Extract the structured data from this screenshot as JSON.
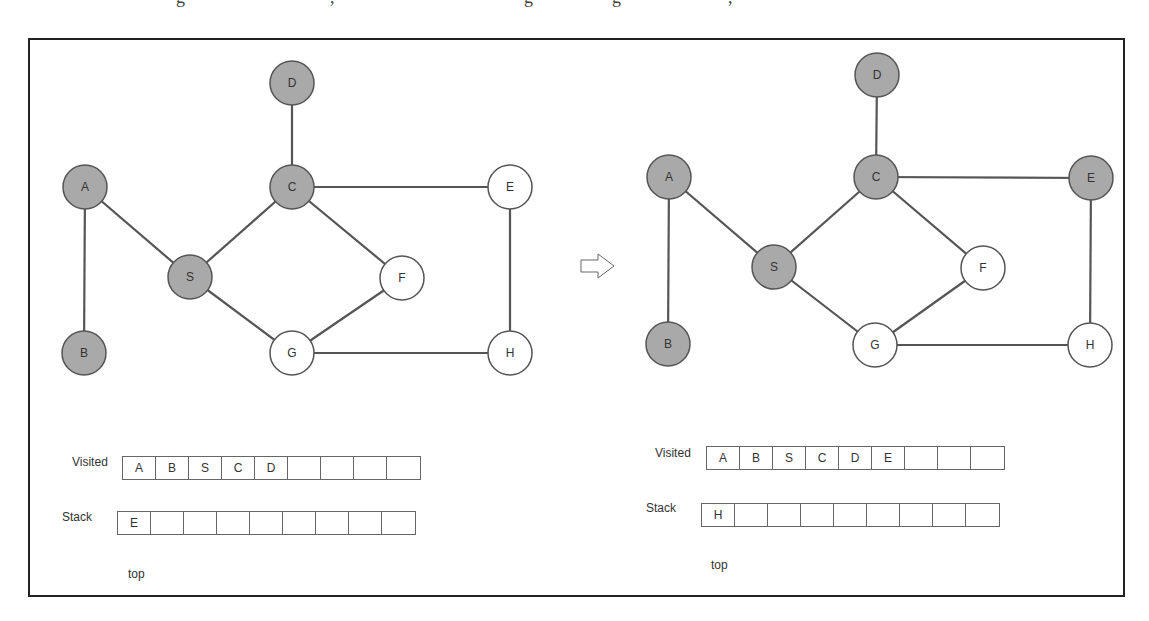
{
  "clipped_top_text": [
    "g",
    ",",
    "g",
    "g",
    ","
  ],
  "transition_arrow": "hollow-right-arrow",
  "colors": {
    "visited_fill": "#a9a9a9",
    "unvisited_fill": "#ffffff",
    "edge": "#555555",
    "node_stroke": "#555555"
  },
  "panels": [
    {
      "id": "before",
      "nodes": [
        {
          "id": "A",
          "visited": true
        },
        {
          "id": "B",
          "visited": true
        },
        {
          "id": "S",
          "visited": true
        },
        {
          "id": "C",
          "visited": true
        },
        {
          "id": "D",
          "visited": true
        },
        {
          "id": "E",
          "visited": false
        },
        {
          "id": "F",
          "visited": false
        },
        {
          "id": "G",
          "visited": false
        },
        {
          "id": "H",
          "visited": false
        }
      ],
      "edges": [
        [
          "A",
          "B"
        ],
        [
          "A",
          "S"
        ],
        [
          "S",
          "C"
        ],
        [
          "S",
          "G"
        ],
        [
          "C",
          "D"
        ],
        [
          "C",
          "E"
        ],
        [
          "C",
          "F"
        ],
        [
          "F",
          "G"
        ],
        [
          "G",
          "H"
        ],
        [
          "E",
          "H"
        ]
      ],
      "visited_label": "Visited",
      "visited": [
        "A",
        "B",
        "S",
        "C",
        "D",
        "",
        "",
        "",
        ""
      ],
      "stack_label": "Stack",
      "stack": [
        "E",
        "",
        "",
        "",
        "",
        "",
        "",
        "",
        ""
      ],
      "top_label": "top"
    },
    {
      "id": "after",
      "nodes": [
        {
          "id": "A",
          "visited": true
        },
        {
          "id": "B",
          "visited": true
        },
        {
          "id": "S",
          "visited": true
        },
        {
          "id": "C",
          "visited": true
        },
        {
          "id": "D",
          "visited": true
        },
        {
          "id": "E",
          "visited": true
        },
        {
          "id": "F",
          "visited": false
        },
        {
          "id": "G",
          "visited": false
        },
        {
          "id": "H",
          "visited": false
        }
      ],
      "edges": [
        [
          "A",
          "B"
        ],
        [
          "A",
          "S"
        ],
        [
          "S",
          "C"
        ],
        [
          "S",
          "G"
        ],
        [
          "C",
          "D"
        ],
        [
          "C",
          "E"
        ],
        [
          "C",
          "F"
        ],
        [
          "F",
          "G"
        ],
        [
          "G",
          "H"
        ],
        [
          "E",
          "H"
        ]
      ],
      "visited_label": "Visited",
      "visited": [
        "A",
        "B",
        "S",
        "C",
        "D",
        "E",
        "",
        "",
        ""
      ],
      "stack_label": "Stack",
      "stack": [
        "H",
        "",
        "",
        "",
        "",
        "",
        "",
        "",
        ""
      ],
      "top_label": "top"
    }
  ]
}
